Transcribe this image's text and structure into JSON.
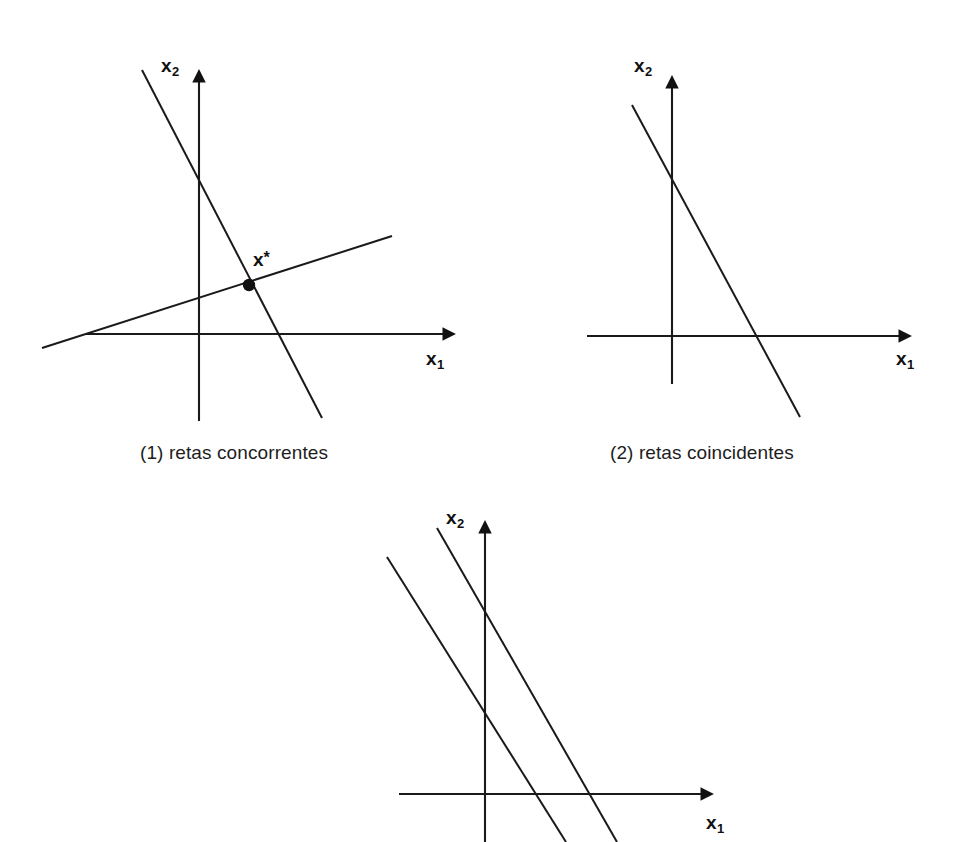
{
  "figure": {
    "background_color": "#ffffff",
    "ink_color": "#1a1a1a",
    "panel_count": 3
  },
  "panels": [
    {
      "id": "panel-1",
      "caption": "(1) retas concorrentes",
      "axes": {
        "x_label": "x",
        "x_sub": "1",
        "y_label": "x",
        "y_sub": "2",
        "origin": {
          "x": 199,
          "y": 334
        },
        "x_axis": {
          "x1": 86,
          "y1": 334,
          "x2": 452,
          "y2": 334
        },
        "y_axis": {
          "x1": 199,
          "y1": 421,
          "x2": 199,
          "y2": 72
        }
      },
      "lines": [
        {
          "name": "reta-inclinada-negativa",
          "x1": 142,
          "y1": 70,
          "x2": 322,
          "y2": 418
        },
        {
          "name": "reta-inclinada-positiva",
          "x1": 42,
          "y1": 348,
          "x2": 392,
          "y2": 236
        }
      ],
      "solution_point": {
        "label": "x",
        "superscript": "*",
        "x": 249,
        "y": 285,
        "radius": 6
      }
    },
    {
      "id": "panel-2",
      "caption": "(2) retas coincidentes",
      "axes": {
        "x_label": "x",
        "x_sub": "1",
        "y_label": "x",
        "y_sub": "2",
        "origin": {
          "x": 672,
          "y": 336
        },
        "x_axis": {
          "x1": 587,
          "y1": 336,
          "x2": 908,
          "y2": 336
        },
        "y_axis": {
          "x1": 672,
          "y1": 384,
          "x2": 672,
          "y2": 74
        }
      },
      "lines": [
        {
          "name": "retas-coincidentes",
          "x1": 632,
          "y1": 105,
          "x2": 800,
          "y2": 417
        }
      ],
      "solution_point": null
    },
    {
      "id": "panel-3",
      "caption": "",
      "axes": {
        "x_label": "x",
        "x_sub": "1",
        "y_label": "x",
        "y_sub": "2",
        "origin": {
          "x": 485,
          "y": 794
        },
        "x_axis": {
          "x1": 399,
          "y1": 794,
          "x2": 710,
          "y2": 794
        },
        "y_axis": {
          "x1": 485,
          "y1": 842,
          "x2": 485,
          "y2": 520
        }
      },
      "lines": [
        {
          "name": "reta-paralela-esquerda",
          "x1": 387,
          "y1": 557,
          "x2": 566,
          "y2": 842
        },
        {
          "name": "reta-paralela-direita",
          "x1": 437,
          "y1": 528,
          "x2": 617,
          "y2": 842
        }
      ],
      "solution_point": null
    }
  ]
}
